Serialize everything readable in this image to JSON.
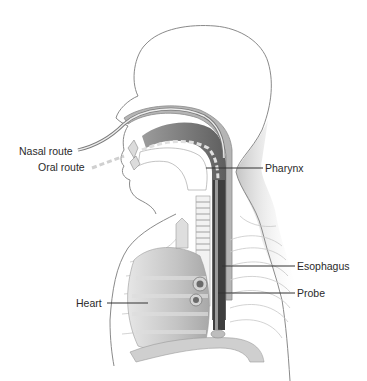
{
  "figure": {
    "labels": {
      "nasal_route": "Nasal route",
      "oral_route": "Oral route",
      "pharynx": "Pharynx",
      "esophagus": "Esophagus",
      "probe": "Probe",
      "heart": "Heart"
    },
    "colors": {
      "background": "#ffffff",
      "outline": "#8a8a8a",
      "airway_dark": "#5a5a5a",
      "airway_mid": "#9a9a9a",
      "probe_dash": "#d8d8d8",
      "heart_fill": "#c8c8c8",
      "rib_lines": "#c8c8c8",
      "label_text": "#2a2a2a"
    }
  }
}
